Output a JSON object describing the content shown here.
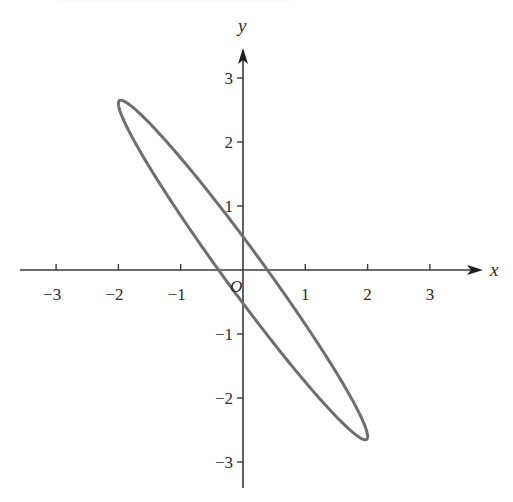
{
  "chart_data": {
    "type": "line",
    "title": "",
    "xlabel": "x",
    "ylabel": "y",
    "origin_label": "O",
    "xlim": [
      -3.6,
      3.9
    ],
    "ylim": [
      -3.4,
      3.7
    ],
    "x_ticks": [
      -3,
      -2,
      -1,
      1,
      2,
      3
    ],
    "x_tick_labels": [
      "−3",
      "−2",
      "−1",
      "1",
      "2",
      "3"
    ],
    "y_ticks": [
      -3,
      -2,
      -1,
      1,
      2,
      3
    ],
    "y_tick_labels": [
      "−3",
      "−2",
      "−1",
      "1",
      "2",
      "3"
    ],
    "grid": false,
    "legend": null,
    "series": [
      {
        "name": "ellipse",
        "kind": "closed-curve",
        "parametric": {
          "x": "2 cos t",
          "y": "-2.6 cos t + 0.52 sin t",
          "t_range": [
            0,
            6.2832
          ]
        },
        "key_points": [
          {
            "label": "upper-left tip",
            "x": -2.0,
            "y": 2.6
          },
          {
            "label": "lower-right tip",
            "x": 2.0,
            "y": -2.6
          },
          {
            "label": "y-intercept upper",
            "x": 0,
            "y": 0.52
          },
          {
            "label": "y-intercept lower",
            "x": 0,
            "y": -0.52
          },
          {
            "label": "x-intercept right",
            "x": 0.39,
            "y": 0
          },
          {
            "label": "x-intercept left",
            "x": -0.39,
            "y": 0
          }
        ],
        "color": "#6e6e6e"
      }
    ]
  },
  "layout": {
    "origin_px": [
      243,
      270
    ],
    "px_per_unit_x": 62.3,
    "px_per_unit_y": 64,
    "x_axis_px": [
      20,
      483
    ],
    "y_axis_px": [
      488,
      48
    ]
  }
}
